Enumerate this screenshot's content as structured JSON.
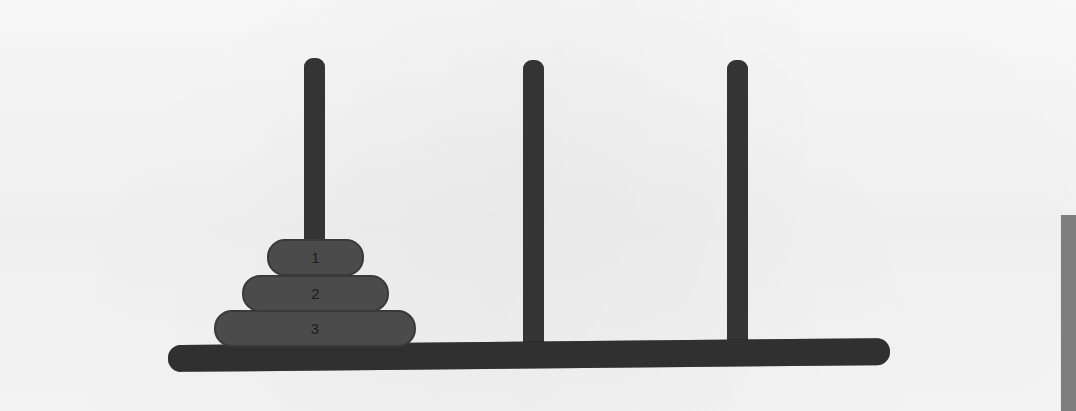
{
  "scene": {
    "title": "Towers of Hanoi",
    "background_color": "#f6f6f6",
    "peg_color": "#343434",
    "base_color": "#303030",
    "disk_color": "#4b4b4b",
    "disk_border_color": "#3a3a3a",
    "disk_label_color": "#1c1c1c",
    "scrollbar_color": "#7e7e7e"
  },
  "base": {
    "label": "base-bar",
    "x": 168,
    "y": 345,
    "width": 722,
    "height": 27
  },
  "pegs": [
    {
      "id": "peg-1",
      "label": "A",
      "x": 304,
      "y": 58,
      "width": 21,
      "height": 290,
      "disk_count": 3
    },
    {
      "id": "peg-2",
      "label": "B",
      "x": 523,
      "y": 60,
      "width": 21,
      "height": 288,
      "disk_count": 0
    },
    {
      "id": "peg-3",
      "label": "C",
      "x": 727,
      "y": 60,
      "width": 21,
      "height": 288,
      "disk_count": 0
    }
  ],
  "disks": [
    {
      "id": "disk-1",
      "label": "1",
      "size": 1,
      "peg": "peg-1",
      "stack_index": 0,
      "x": 267,
      "y": 239,
      "width": 97,
      "height": 37
    },
    {
      "id": "disk-2",
      "label": "2",
      "size": 2,
      "peg": "peg-1",
      "stack_index": 1,
      "x": 242,
      "y": 275,
      "width": 147,
      "height": 37
    },
    {
      "id": "disk-3",
      "label": "3",
      "size": 3,
      "peg": "peg-1",
      "stack_index": 2,
      "x": 214,
      "y": 310,
      "width": 202,
      "height": 37
    }
  ],
  "scrollbar": {
    "label": "vertical-scrollbar-thumb",
    "x": 1060,
    "y": 215,
    "width": 16,
    "height": 196
  }
}
